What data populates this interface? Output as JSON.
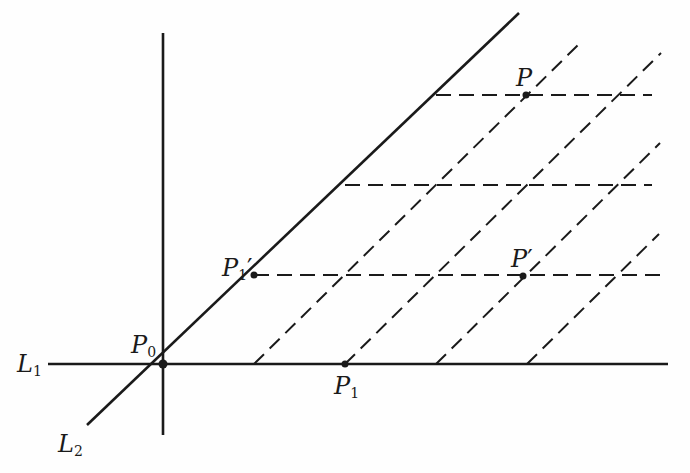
{
  "diagram": {
    "type": "geometric construction",
    "colors": {
      "ink": "#1a1a1a",
      "background": "#fefefe"
    },
    "labels": {
      "L1": {
        "base": "L",
        "sub": "1"
      },
      "L2": {
        "base": "L",
        "sub": "2"
      },
      "P0": {
        "base": "P",
        "sub": "0"
      },
      "P1": {
        "base": "P",
        "sub": "1"
      },
      "P1prime": {
        "base": "P",
        "sub": "1",
        "prime": "′"
      },
      "P": {
        "base": "P"
      },
      "Pprime": {
        "base": "P",
        "prime": "′"
      }
    },
    "lines": {
      "L1": "solid horizontal line through P0 and P1",
      "L2": "solid diagonal line through P0 and P1′",
      "vertical_axis": "solid vertical line through P0",
      "dashed_parallels_to_L1": 3,
      "dashed_parallels_to_L2": 4
    }
  }
}
